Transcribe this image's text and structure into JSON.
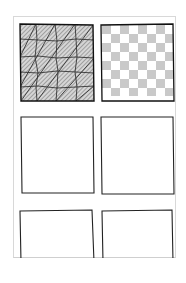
{
  "worksheet": {
    "layout": {
      "columns": 2,
      "rows": 3
    },
    "colors": {
      "ink": "#1a1a1a",
      "shade": "#bdbdbd",
      "page_border": "#d8d8d8"
    },
    "tiles": [
      {
        "position": "row1-col1",
        "pattern": "triangular-grid-hatched",
        "filled": true
      },
      {
        "position": "row1-col2",
        "pattern": "checkerboard",
        "filled": true
      },
      {
        "position": "row2-col1",
        "pattern": "none",
        "filled": false
      },
      {
        "position": "row2-col2",
        "pattern": "none",
        "filled": false
      },
      {
        "position": "row3-col1",
        "pattern": "none",
        "filled": false
      },
      {
        "position": "row3-col2",
        "pattern": "none",
        "filled": false
      }
    ]
  }
}
